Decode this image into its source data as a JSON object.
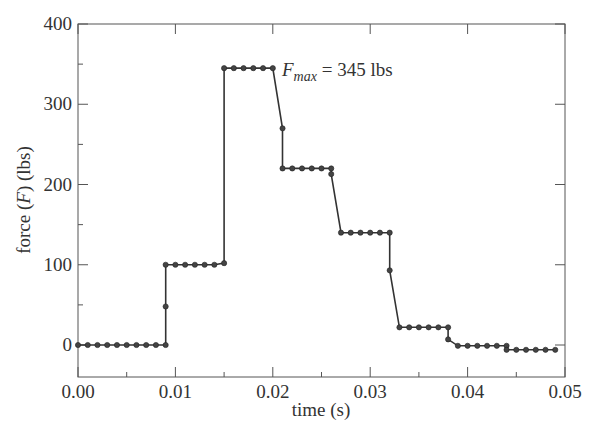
{
  "chart_data": {
    "type": "line",
    "title": "",
    "xlabel": "time (s)",
    "ylabel_parts": [
      "force (",
      "F",
      ") (lbs)"
    ],
    "ylabel": "force (F) (lbs)",
    "xlim": [
      0.0,
      0.05
    ],
    "ylim": [
      -40,
      400
    ],
    "x_ticks": [
      "0.00",
      "0.01",
      "0.02",
      "0.03",
      "0.04",
      "0.05"
    ],
    "y_ticks": [
      "0",
      "100",
      "200",
      "300",
      "400"
    ],
    "grid": false,
    "legend": null,
    "annotation": {
      "symbol": "F",
      "subscript": "max",
      "text": " = 345 lbs",
      "x": 0.0205,
      "y": 345
    },
    "series": [
      {
        "name": "force",
        "marker": "circle",
        "x": [
          0.0,
          0.001,
          0.002,
          0.003,
          0.004,
          0.005,
          0.006,
          0.007,
          0.008,
          0.009,
          0.009,
          0.009,
          0.01,
          0.011,
          0.012,
          0.013,
          0.014,
          0.015,
          0.015,
          0.016,
          0.017,
          0.018,
          0.019,
          0.02,
          0.021,
          0.021,
          0.022,
          0.023,
          0.024,
          0.025,
          0.026,
          0.026,
          0.027,
          0.028,
          0.029,
          0.03,
          0.031,
          0.032,
          0.032,
          0.033,
          0.034,
          0.035,
          0.036,
          0.037,
          0.038,
          0.038,
          0.039,
          0.04,
          0.041,
          0.042,
          0.043,
          0.044,
          0.044,
          0.045,
          0.046,
          0.047,
          0.048,
          0.049
        ],
        "y": [
          0,
          0,
          0,
          0,
          0,
          0,
          0,
          0,
          0,
          0,
          48,
          100,
          100,
          100,
          100,
          100,
          100,
          102,
          345,
          345,
          345,
          345,
          345,
          345,
          270,
          220,
          220,
          220,
          220,
          220,
          220,
          213,
          140,
          140,
          140,
          140,
          140,
          140,
          93,
          22,
          22,
          22,
          22,
          22,
          22,
          7,
          -1,
          -1,
          -1,
          -1,
          -1,
          -1,
          -6,
          -6,
          -6,
          -6,
          -6,
          -6
        ]
      }
    ]
  }
}
